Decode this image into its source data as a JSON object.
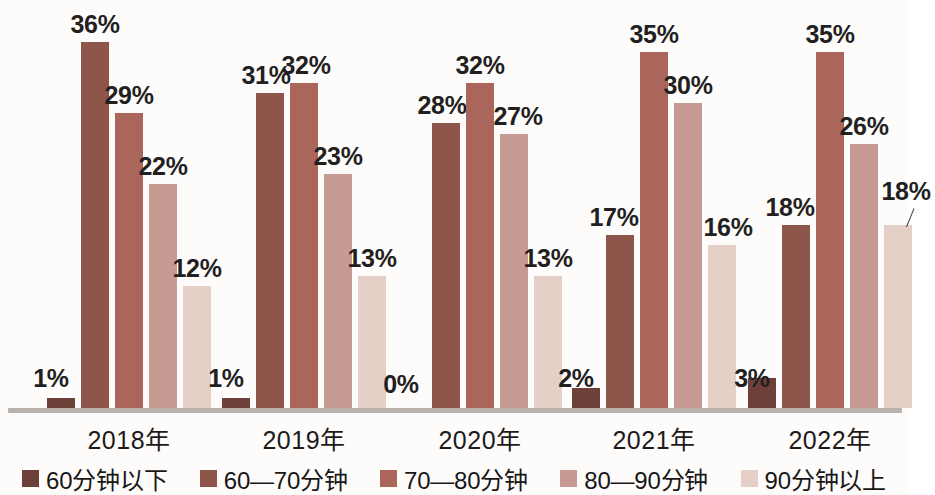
{
  "chart_data": {
    "type": "bar",
    "title": "",
    "subtitle": "",
    "xlabel": "",
    "ylabel": "",
    "ylim": [
      0,
      40
    ],
    "grid": false,
    "legend_position": "bottom",
    "categories": [
      "2018年",
      "2019年",
      "2020年",
      "2021年",
      "2022年"
    ],
    "series": [
      {
        "name": "60分钟以下",
        "color": "#6d4139",
        "values": [
          1,
          1,
          0,
          2,
          3
        ],
        "labels": [
          "1%",
          "1%",
          "0%",
          "2%",
          "3%"
        ]
      },
      {
        "name": "60—70分钟",
        "color": "#8e564a",
        "values": [
          36,
          31,
          28,
          17,
          18
        ],
        "labels": [
          "36%",
          "31%",
          "28%",
          "17%",
          "18%"
        ]
      },
      {
        "name": "70—80分钟",
        "color": "#ab665b",
        "values": [
          29,
          32,
          32,
          35,
          35
        ],
        "labels": [
          "29%",
          "32%",
          "32%",
          "35%",
          "35%"
        ]
      },
      {
        "name": "80—90分钟",
        "color": "#c69b94",
        "values": [
          22,
          23,
          27,
          30,
          26
        ],
        "labels": [
          "22%",
          "23%",
          "27%",
          "30%",
          "26%"
        ]
      },
      {
        "name": "90分钟以上",
        "color": "#e4d0c7",
        "values": [
          12,
          13,
          13,
          16,
          18
        ],
        "labels": [
          "12%",
          "13%",
          "13%",
          "16%",
          "18%"
        ]
      }
    ]
  },
  "legend": {
    "items": [
      {
        "label": "60分钟以下",
        "color": "#6d4139"
      },
      {
        "label": "60—70分钟",
        "color": "#8e564a"
      },
      {
        "label": "70—80分钟",
        "color": "#ab665b"
      },
      {
        "label": "80—90分钟",
        "color": "#c69b94"
      },
      {
        "label": "90分钟以上",
        "color": "#e4d0c7"
      }
    ]
  },
  "axis": {
    "categories": [
      "2018年",
      "2019年",
      "2020年",
      "2021年",
      "2022年"
    ]
  }
}
